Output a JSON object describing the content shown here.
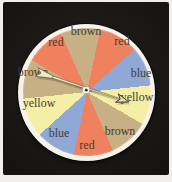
{
  "figure": {
    "kind": "probability-spinner-photo",
    "colors": {
      "page_margin": "#f0efec",
      "photo_background": "#1b1916",
      "wheel_face": "#f7f3ea",
      "label_text": "#463d2f",
      "pointer_fill": "#ece4c4",
      "pointer_outline": "#5a4a2e",
      "pointer_head_outline": "#3f321d",
      "pin_fill": "#f6f3ea",
      "pin_dot": "#33291b"
    },
    "sector_colors": {
      "brown": "#c7b083",
      "red": "#f0815f",
      "blue": "#8fa8d5",
      "yellow": "#f4efa4"
    },
    "wheel": {
      "center_x": 86.5,
      "center_y": 92,
      "rim_radius": 68.5,
      "sector_radius": 64,
      "start_angle_deg": -24,
      "sector_angle_deg": 36
    },
    "sectors": [
      {
        "color": "brown",
        "label": "brown",
        "label_x": 86,
        "label_y": 31
      },
      {
        "color": "red",
        "label": "red",
        "label_x": 122,
        "label_y": 41
      },
      {
        "color": "blue",
        "label": "blue",
        "label_x": 141,
        "label_y": 73
      },
      {
        "color": "yellow",
        "label": "yellow",
        "label_x": 137,
        "label_y": 97
      },
      {
        "color": "brown",
        "label": "brown",
        "label_x": 120,
        "label_y": 131
      },
      {
        "color": "red",
        "label": "red",
        "label_x": 87,
        "label_y": 145
      },
      {
        "color": "blue",
        "label": "blue",
        "label_x": 59,
        "label_y": 133
      },
      {
        "color": "yellow",
        "label": "yellow",
        "label_x": 39,
        "label_y": 103
      },
      {
        "color": "brown",
        "label": "brown",
        "label_x": 33,
        "label_y": 72
      },
      {
        "color": "red",
        "label": "red",
        "label_x": 56,
        "label_y": 42
      }
    ],
    "pointer": {
      "angle_deg": 18,
      "pivot_x": 86,
      "pivot_y": 88
    }
  }
}
